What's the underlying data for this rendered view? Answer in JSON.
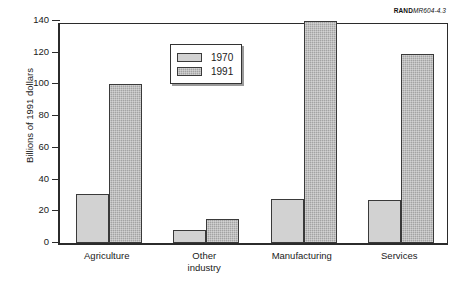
{
  "source_credit": {
    "prefix": "RAND",
    "suffix": "MR604-4.3"
  },
  "chart_data": {
    "type": "bar",
    "title": "",
    "subtitle": "",
    "xlabel": "",
    "ylabel": "Billions of 1991 dollars",
    "categories": [
      "Agriculture",
      "Other industry",
      "Manufacturing",
      "Services"
    ],
    "category_lines": [
      [
        "Agriculture"
      ],
      [
        "Other",
        "industry"
      ],
      [
        "Manufacturing"
      ],
      [
        "Services"
      ]
    ],
    "series": [
      {
        "name": "1970",
        "values": [
          31,
          8,
          28,
          27
        ],
        "color": "#d2d2d2"
      },
      {
        "name": "1991",
        "values": [
          100,
          15,
          140,
          119
        ],
        "color": "#a3a3a3"
      }
    ],
    "ylim": [
      0,
      140
    ],
    "yticks": [
      0,
      20,
      40,
      60,
      80,
      100,
      120,
      140
    ],
    "ytick_labels": [
      "0",
      "20",
      "40",
      "60",
      "80",
      "100",
      "120",
      "140"
    ],
    "grid": false,
    "legend_position": "upper center",
    "legend_entries": [
      "1970",
      "1991"
    ]
  }
}
